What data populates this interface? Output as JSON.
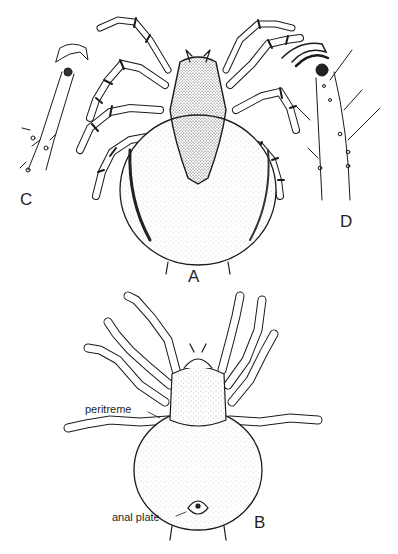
{
  "figure": {
    "panels": [
      {
        "id": "A",
        "label": "A",
        "description": "dorsal view of mite"
      },
      {
        "id": "B",
        "label": "B",
        "description": "ventral view of mite"
      },
      {
        "id": "C",
        "label": "C",
        "description": "tarsus with claw (detail)"
      },
      {
        "id": "D",
        "label": "D",
        "description": "tarsus with curved claw (detail)"
      }
    ],
    "annotations": {
      "peritreme": "peritreme",
      "anal_plate": "anal plate"
    },
    "colors": {
      "ink": "#1a1a1a",
      "stipple": "#555555",
      "background": "#ffffff"
    }
  }
}
